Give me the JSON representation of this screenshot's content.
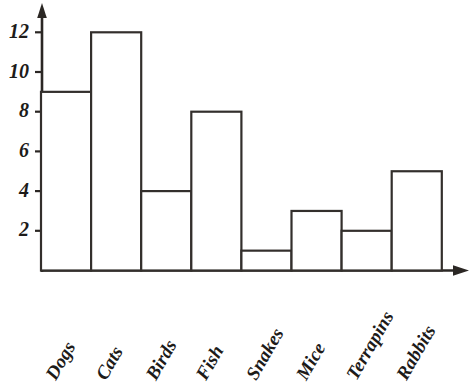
{
  "chart_data": {
    "type": "bar",
    "title": "",
    "subtitle": "",
    "xlabel": "",
    "ylabel": "",
    "categories": [
      "Dogs",
      "Cats",
      "Birds",
      "Fish",
      "Snakes",
      "Mice",
      "Terrapins",
      "Rabbits"
    ],
    "values": [
      9,
      12,
      4,
      8,
      1,
      3,
      2,
      5
    ],
    "ylim": [
      0,
      13
    ],
    "ytick_labels": [
      "2",
      "4",
      "6",
      "8",
      "10",
      "12"
    ],
    "ytick_values": [
      2,
      4,
      6,
      8,
      10,
      12
    ],
    "grid": false,
    "legend": null,
    "bar_style": "hollow-adjacent",
    "axis_arrows": true,
    "colors": {
      "background": "#ffffff",
      "axis": "#2b2724",
      "bar_outline": "#332f2c",
      "bar_fill": "#ffffff",
      "text": "#1d1b19"
    }
  },
  "axes": {
    "y_axis_name": "frequency-axis",
    "x_axis_name": "category-axis",
    "x_label_rotation_deg": -60
  }
}
